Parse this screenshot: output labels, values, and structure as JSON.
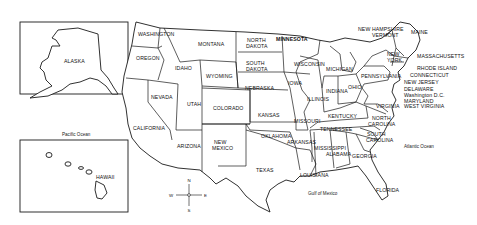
{
  "map": {
    "title": "United States",
    "insets": {
      "alaska": {
        "label": "ALASKA"
      },
      "hawaii": {
        "label": "HAWAII"
      }
    },
    "water_bodies": {
      "pacific": "Pacific Ocean",
      "atlantic": "Atlantic Ocean",
      "gulf": "Gulf of Mexico"
    },
    "compass": {
      "n": "N",
      "s": "S",
      "e": "E",
      "w": "W"
    },
    "states": {
      "washington": "WASHINGTON",
      "oregon": "OREGON",
      "california": "CALIFORNIA",
      "nevada": "NEVADA",
      "idaho": "IDAHO",
      "montana": "MONTANA",
      "wyoming": "WYOMING",
      "utah": "UTAH",
      "colorado": "COLORADO",
      "arizona": "ARIZONA",
      "new_mexico_1": "NEW",
      "new_mexico_2": "MEXICO",
      "north_dakota_1": "NORTH",
      "north_dakota_2": "DAKOTA",
      "south_dakota_1": "SOUTH",
      "south_dakota_2": "DAKOTA",
      "nebraska": "NEBRASKA",
      "kansas": "KANSAS",
      "oklahoma": "OKLAHOMA",
      "texas": "TEXAS",
      "minnesota": "MINNESOTA",
      "iowa": "IOWA",
      "missouri": "MISSOURI",
      "arkansas": "ARKANSAS",
      "louisiana": "LOUISIANA",
      "wisconsin": "WISCONSIN",
      "illinois": "ILLINOIS",
      "michigan": "MICHIGAN",
      "indiana": "INDIANA",
      "ohio": "OHIO",
      "kentucky": "KENTUCKY",
      "tennessee": "TENNESSEE",
      "mississippi": "MISSISSIPPI",
      "alabama": "ALABAMA",
      "georgia": "GEORGIA",
      "florida": "FLORIDA",
      "south_carolina_1": "SOUTH",
      "south_carolina_2": "CAROLINA",
      "north_carolina_1": "NORTH",
      "north_carolina_2": "CAROLINA",
      "virginia": "VIRGINIA",
      "west_virginia": "WEST VIRGINIA",
      "pennsylvania": "PENNSYLVANIA",
      "new_york_1": "NEW",
      "new_york_2": "YORK",
      "vermont": "VERMONT",
      "new_hampshire": "NEW HAMPSHIRE",
      "maine": "MAINE",
      "massachusetts": "MASSACHUSETTS",
      "rhode_island": "RHODE ISLAND",
      "connecticut": "CONNECTICUT",
      "new_jersey": "NEW JERSEY",
      "delaware": "DELAWARE",
      "washington_dc": "Washington D.C.",
      "maryland": "MARYLAND"
    }
  }
}
